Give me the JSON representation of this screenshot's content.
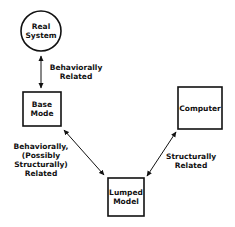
{
  "diagram": {
    "nodes": [
      {
        "id": "real-system",
        "shape": "circle",
        "label": "Real\nSystem"
      },
      {
        "id": "base-mode",
        "shape": "box",
        "label": "Base\nMode"
      },
      {
        "id": "computer",
        "shape": "box",
        "label": "Computer"
      },
      {
        "id": "lumped-model",
        "shape": "box",
        "label": "Lumped\nModel"
      }
    ],
    "edges": [
      {
        "from": "real-system",
        "to": "base-mode",
        "bidirectional": true,
        "label": "Behaviorally\nRelated"
      },
      {
        "from": "base-mode",
        "to": "lumped-model",
        "bidirectional": true,
        "label": "Behaviorally,\n(Possibly\nStructurally)\nRelated"
      },
      {
        "from": "computer",
        "to": "lumped-model",
        "bidirectional": true,
        "label": "Structurally\nRelated"
      }
    ],
    "colors": {
      "stroke": "#111111",
      "background": "#ffffff"
    }
  }
}
